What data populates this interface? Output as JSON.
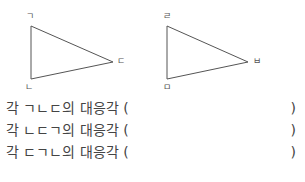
{
  "figures": {
    "triangle1": {
      "vertices": [
        {
          "name": "ㄱ",
          "x": 31,
          "y": 26,
          "label_x": 26,
          "label_y": 12
        },
        {
          "name": "ㄴ",
          "x": 31,
          "y": 79,
          "label_x": 25,
          "label_y": 83
        },
        {
          "name": "ㄷ",
          "x": 113,
          "y": 62,
          "label_x": 117,
          "label_y": 57
        }
      ]
    },
    "triangle2": {
      "vertices": [
        {
          "name": "ㄹ",
          "x": 167,
          "y": 26,
          "label_x": 163,
          "label_y": 12
        },
        {
          "name": "ㅁ",
          "x": 167,
          "y": 79,
          "label_x": 163,
          "label_y": 83
        },
        {
          "name": "ㅂ",
          "x": 248,
          "y": 62,
          "label_x": 253,
          "label_y": 57
        }
      ]
    }
  },
  "questions": [
    {
      "text": "각 ㄱㄴㄷ의 대응각 (",
      "close": ")"
    },
    {
      "text": "각 ㄴㄷㄱ의 대응각 (",
      "close": ")"
    },
    {
      "text": "각 ㄷㄱㄴ의 대응각 (",
      "close": ")"
    }
  ]
}
